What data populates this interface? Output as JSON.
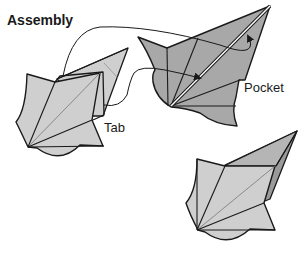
{
  "title": "Assembly",
  "labels": {
    "tab": "Tab",
    "pocket": "Pocket"
  },
  "colors": {
    "light_fill": "#cfcfcf",
    "dark_fill": "#a8a8a8",
    "darker_fill": "#9a9a9a",
    "stroke": "#1a1a1a"
  },
  "pieces": [
    {
      "name": "tab-piece",
      "description": "Light grey folded unit with tab"
    },
    {
      "name": "pocket-piece",
      "description": "Dark grey folded unit with pocket"
    },
    {
      "name": "assembled-piece",
      "description": "Result with tab inserted into pocket"
    }
  ]
}
